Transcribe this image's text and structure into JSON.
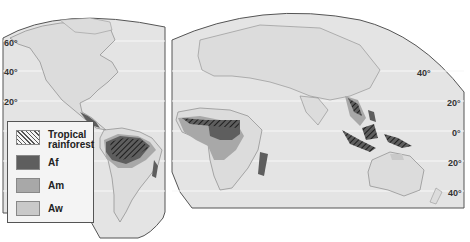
{
  "map": {
    "title": "Tropical rainforest climate distribution (Köppen A climates)",
    "colors": {
      "ocean": "#e4e4e4",
      "land": "#dcdcdc",
      "coast": "#8a8a8a",
      "af": "#5e5e5e",
      "am": "#a8a8a8",
      "aw": "#c9c9c9",
      "hatch": "#1e1e1e",
      "outline": "#555555"
    },
    "latitude_labels_left": [
      "60°",
      "40°",
      "20°"
    ],
    "latitude_labels_right": [
      "40°",
      "20°",
      "0°",
      "20°",
      "40°"
    ]
  },
  "legend": {
    "items": [
      {
        "key": "tropical_rainforest",
        "label_line1": "Tropical",
        "label_line2": "rainforest",
        "pattern": "hatch"
      },
      {
        "key": "af",
        "label": "Af",
        "color": "#5e5e5e"
      },
      {
        "key": "am",
        "label": "Am",
        "color": "#a8a8a8"
      },
      {
        "key": "aw",
        "label": "Aw",
        "color": "#c9c9c9"
      }
    ]
  }
}
